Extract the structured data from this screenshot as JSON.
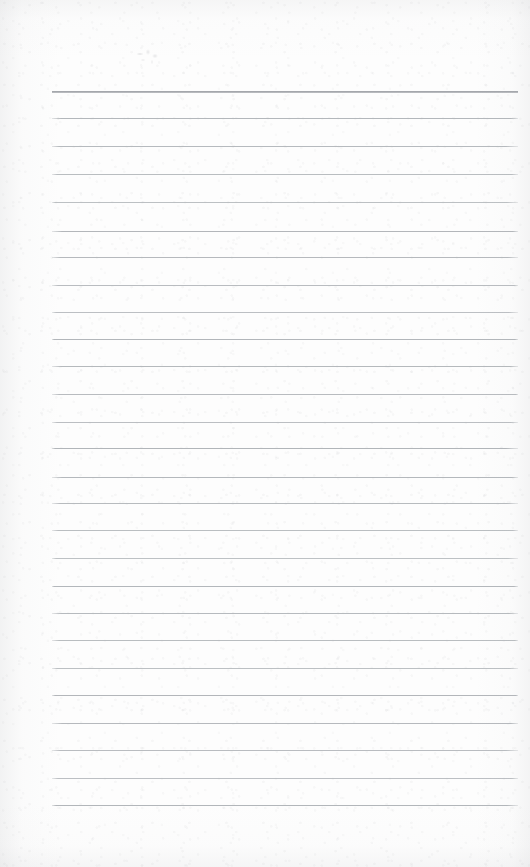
{
  "document": {
    "kind": "scanned-lined-notepad-page",
    "title": "Blank Ruled Notepad Page",
    "body_text": "",
    "has_written_content": false,
    "page_width": 530,
    "page_height": 867
  },
  "paper": {
    "background_color": "#fdfdfd",
    "edge_shade_color": "#b0b2b6",
    "texture": "scanned paper grain"
  },
  "ruling": {
    "line_color": "#b0b4b8",
    "first_line_color": "#96999e",
    "line_thickness_px": 1,
    "first_line_thickness_px": 2,
    "line_count": 25,
    "line_spacing_px": 27.5,
    "left_margin_px": 52,
    "right_edge_px": 518,
    "first_line_y_px": 91,
    "last_line_y_px": 805,
    "line_y_positions": [
      91,
      118,
      146,
      174,
      202,
      231,
      257,
      285,
      312,
      339,
      366,
      394,
      422,
      448,
      477,
      503,
      530,
      558,
      586,
      613,
      640,
      668,
      695,
      723,
      750,
      778,
      805
    ]
  },
  "marks": {
    "pencil_smudge": {
      "label": "faint pencil smudge",
      "x_px": 134,
      "y_px": 49,
      "width_px": 27,
      "height_px": 16
    }
  },
  "margins": {
    "top_blank_band_px": 91,
    "bottom_blank_band_px": 62,
    "has_vertical_margin_rule": false
  }
}
